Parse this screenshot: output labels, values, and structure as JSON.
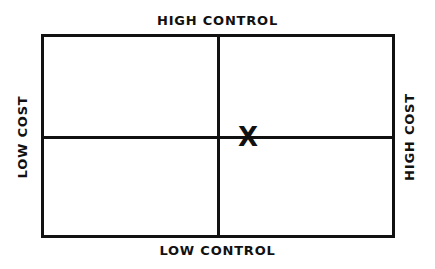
{
  "diagram": {
    "type": "2x2 matrix",
    "labels": {
      "top": "HIGH CONTROL",
      "bottom": "LOW CONTROL",
      "left": "LOW COST",
      "right": "HIGH COST"
    },
    "marker": {
      "symbol": "X",
      "position": "center, slightly right of vertical axis on horizontal axis"
    },
    "colors": {
      "line": "#111111",
      "background": "#ffffff"
    }
  }
}
